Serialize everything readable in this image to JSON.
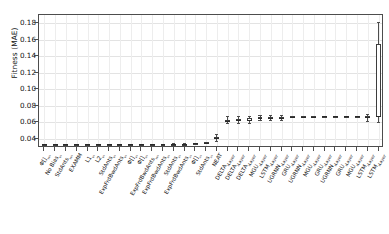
{
  "chart_data": {
    "type": "boxplot",
    "title": "",
    "xlabel": "",
    "ylabel": "Fitness (MAE)",
    "ylim": [
      0.029,
      0.19
    ],
    "yticks": [
      0.04,
      0.06,
      0.08,
      0.1,
      0.12,
      0.14,
      0.16,
      0.18
    ],
    "ytick_labels": [
      "0.04",
      "0.06",
      "0.08",
      "0.10",
      "0.12",
      "0.14",
      "0.16",
      "0.18"
    ],
    "grid": true,
    "legend": "none",
    "orientation": "vertical",
    "categories": [
      "Φ[]₁₆₀",
      "No Bias₆₀",
      "StdAnts₁₆₀",
      "EXAMM",
      "L1₆₀",
      "L2₆₀",
      "StdAnts₆₀",
      "ExpFrdBwdAnts₆₀",
      "Φ[]₄₀",
      "Φ[]₈₀",
      "ExpFrdBwdAnts₁₆₀",
      "ExpFrdBwdAnts₈₀",
      "StdAnts₄₀",
      "ExpFrdBwdAnts₂₀",
      "Φ[]₂₀",
      "StdAnts₂₀",
      "NEAT",
      "DELTA₁_Layer",
      "DELTA₂_Layer",
      "DELTA₃_Layer",
      "MGU₁_Layer",
      "LSTM₁_Layer",
      "UGRNN₁_Layer",
      "GRU₁_Layer",
      "UGRNN₂_Layer",
      "MGU₂_Layer",
      "GRU₂_Layer",
      "UGRNN₃_Layer",
      "GRU₃_Layer",
      "MGU₃_Layer",
      "LSTM₂_Layer",
      "LSTM₃_Layer"
    ],
    "boxes": [
      {
        "category": "Φ[]₁₆₀",
        "whisker_low": 0.033,
        "q1": 0.0332,
        "median": 0.0334,
        "q3": 0.0336,
        "whisker_high": 0.0338
      },
      {
        "category": "No Bias₆₀",
        "whisker_low": 0.0331,
        "q1": 0.0333,
        "median": 0.0335,
        "q3": 0.0337,
        "whisker_high": 0.0339
      },
      {
        "category": "StdAnts₁₆₀",
        "whisker_low": 0.0331,
        "q1": 0.0333,
        "median": 0.0335,
        "q3": 0.0337,
        "whisker_high": 0.0339
      },
      {
        "category": "EXAMM",
        "whisker_low": 0.0332,
        "q1": 0.0334,
        "median": 0.0336,
        "q3": 0.0338,
        "whisker_high": 0.034
      },
      {
        "category": "L1₆₀",
        "whisker_low": 0.0332,
        "q1": 0.0334,
        "median": 0.0336,
        "q3": 0.0338,
        "whisker_high": 0.034
      },
      {
        "category": "L2₆₀",
        "whisker_low": 0.0332,
        "q1": 0.0334,
        "median": 0.0336,
        "q3": 0.0338,
        "whisker_high": 0.034
      },
      {
        "category": "StdAnts₆₀",
        "whisker_low": 0.0333,
        "q1": 0.0335,
        "median": 0.0337,
        "q3": 0.0339,
        "whisker_high": 0.0341
      },
      {
        "category": "ExpFrdBwdAnts₆₀",
        "whisker_low": 0.0333,
        "q1": 0.0335,
        "median": 0.0337,
        "q3": 0.0339,
        "whisker_high": 0.0341
      },
      {
        "category": "Φ[]₄₀",
        "whisker_low": 0.0334,
        "q1": 0.0336,
        "median": 0.0338,
        "q3": 0.034,
        "whisker_high": 0.0342
      },
      {
        "category": "Φ[]₈₀",
        "whisker_low": 0.0334,
        "q1": 0.0336,
        "median": 0.0338,
        "q3": 0.034,
        "whisker_high": 0.0342
      },
      {
        "category": "ExpFrdBwdAnts₁₆₀",
        "whisker_low": 0.0335,
        "q1": 0.0337,
        "median": 0.0339,
        "q3": 0.0341,
        "whisker_high": 0.0343
      },
      {
        "category": "ExpFrdBwdAnts₈₀",
        "whisker_low": 0.0335,
        "q1": 0.0337,
        "median": 0.0339,
        "q3": 0.0341,
        "whisker_high": 0.0343
      },
      {
        "category": "StdAnts₄₀",
        "whisker_low": 0.0336,
        "q1": 0.0338,
        "median": 0.0341,
        "q3": 0.0344,
        "whisker_high": 0.0346
      },
      {
        "category": "ExpFrdBwdAnts₂₀",
        "whisker_low": 0.0338,
        "q1": 0.034,
        "median": 0.0342,
        "q3": 0.0344,
        "whisker_high": 0.0346
      },
      {
        "category": "Φ[]₂₀",
        "whisker_low": 0.0347,
        "q1": 0.0349,
        "median": 0.0351,
        "q3": 0.0353,
        "whisker_high": 0.0355
      },
      {
        "category": "StdAnts₂₀",
        "whisker_low": 0.0352,
        "q1": 0.0354,
        "median": 0.0356,
        "q3": 0.0358,
        "whisker_high": 0.036
      },
      {
        "category": "NEAT",
        "whisker_low": 0.038,
        "q1": 0.04,
        "median": 0.0413,
        "q3": 0.0428,
        "whisker_high": 0.0455
      },
      {
        "category": "DELTA₁_Layer",
        "whisker_low": 0.059,
        "q1": 0.061,
        "median": 0.0621,
        "q3": 0.0632,
        "whisker_high": 0.0672
      },
      {
        "category": "DELTA₂_Layer",
        "whisker_low": 0.0596,
        "q1": 0.0616,
        "median": 0.0627,
        "q3": 0.0638,
        "whisker_high": 0.0676
      },
      {
        "category": "DELTA₃_Layer",
        "whisker_low": 0.0594,
        "q1": 0.0614,
        "median": 0.0634,
        "q3": 0.0648,
        "whisker_high": 0.0672
      },
      {
        "category": "MGU₁_Layer",
        "whisker_low": 0.0628,
        "q1": 0.0645,
        "median": 0.0653,
        "q3": 0.066,
        "whisker_high": 0.0684
      },
      {
        "category": "LSTM₁_Layer",
        "whisker_low": 0.0634,
        "q1": 0.065,
        "median": 0.0657,
        "q3": 0.0663,
        "whisker_high": 0.0686
      },
      {
        "category": "UGRNN₁_Layer",
        "whisker_low": 0.063,
        "q1": 0.0648,
        "median": 0.0658,
        "q3": 0.0668,
        "whisker_high": 0.0688
      },
      {
        "category": "GRU₁_Layer",
        "whisker_low": 0.066,
        "q1": 0.0666,
        "median": 0.0669,
        "q3": 0.0672,
        "whisker_high": 0.0678
      },
      {
        "category": "UGRNN₂_Layer",
        "whisker_low": 0.0666,
        "q1": 0.0669,
        "median": 0.0671,
        "q3": 0.0673,
        "whisker_high": 0.0676
      },
      {
        "category": "MGU₂_Layer",
        "whisker_low": 0.0666,
        "q1": 0.0669,
        "median": 0.0671,
        "q3": 0.0673,
        "whisker_high": 0.0676
      },
      {
        "category": "GRU₂_Layer",
        "whisker_low": 0.0667,
        "q1": 0.067,
        "median": 0.0672,
        "q3": 0.0674,
        "whisker_high": 0.0677
      },
      {
        "category": "UGRNN₃_Layer",
        "whisker_low": 0.0667,
        "q1": 0.067,
        "median": 0.0672,
        "q3": 0.0674,
        "whisker_high": 0.0677
      },
      {
        "category": "GRU₃_Layer",
        "whisker_low": 0.0668,
        "q1": 0.0671,
        "median": 0.0673,
        "q3": 0.0675,
        "whisker_high": 0.0678
      },
      {
        "category": "MGU₃_Layer",
        "whisker_low": 0.0668,
        "q1": 0.0671,
        "median": 0.0673,
        "q3": 0.0675,
        "whisker_high": 0.0678
      },
      {
        "category": "LSTM₂_Layer",
        "whisker_low": 0.062,
        "q1": 0.0648,
        "median": 0.0664,
        "q3": 0.068,
        "whisker_high": 0.0706
      },
      {
        "category": "LSTM₃_Layer",
        "whisker_low": 0.06,
        "q1": 0.0665,
        "median": 0.0682,
        "q3": 0.155,
        "whisker_high": 0.181
      }
    ]
  }
}
